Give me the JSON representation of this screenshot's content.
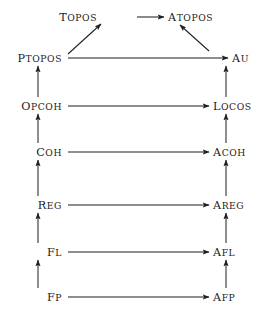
{
  "diagram": {
    "type": "commutative-diagram",
    "title": "",
    "style": {
      "line_color": "#1f1f1f",
      "text_color": "#1c1c1c",
      "background": "#ffffff"
    },
    "nodes": [
      {
        "id": "topos",
        "label": "TOPOS",
        "column": "left",
        "row": 0,
        "x": 97,
        "y": 17,
        "align": "right"
      },
      {
        "id": "atopos",
        "label": "ATOPOS",
        "column": "right",
        "row": 0,
        "x": 168,
        "y": 17,
        "align": "left"
      },
      {
        "id": "ptopos",
        "label": "PTOPOS",
        "column": "left",
        "row": 1,
        "x": 62,
        "y": 58,
        "align": "right"
      },
      {
        "id": "au",
        "label": "AU",
        "column": "right",
        "row": 1,
        "x": 232,
        "y": 58,
        "align": "left"
      },
      {
        "id": "opcoh",
        "label": "OPCOH",
        "column": "left",
        "row": 2,
        "x": 62,
        "y": 106,
        "align": "right"
      },
      {
        "id": "locos",
        "label": "LOCOS",
        "column": "right",
        "row": 2,
        "x": 213,
        "y": 106,
        "align": "left"
      },
      {
        "id": "coh",
        "label": "COH",
        "column": "left",
        "row": 3,
        "x": 62,
        "y": 152,
        "align": "right"
      },
      {
        "id": "acoh",
        "label": "ACOH",
        "column": "right",
        "row": 3,
        "x": 213,
        "y": 152,
        "align": "left"
      },
      {
        "id": "reg",
        "label": "REG",
        "column": "left",
        "row": 4,
        "x": 62,
        "y": 205,
        "align": "right"
      },
      {
        "id": "areg",
        "label": "AREG",
        "column": "right",
        "row": 4,
        "x": 213,
        "y": 205,
        "align": "left"
      },
      {
        "id": "fl",
        "label": "FL",
        "column": "left",
        "row": 5,
        "x": 62,
        "y": 252,
        "align": "right"
      },
      {
        "id": "afl",
        "label": "AFL",
        "column": "right",
        "row": 5,
        "x": 213,
        "y": 252,
        "align": "left"
      },
      {
        "id": "fp",
        "label": "FP",
        "column": "left",
        "row": 6,
        "x": 62,
        "y": 297,
        "align": "right"
      },
      {
        "id": "afp",
        "label": "AFP",
        "column": "right",
        "row": 6,
        "x": 213,
        "y": 297,
        "align": "left"
      }
    ],
    "edges": [
      {
        "id": "e-topos-atopos",
        "from": "topos",
        "to": "atopos",
        "kind": "horizontal",
        "x1": 137,
        "y1": 17,
        "x2": 164,
        "y2": 17
      },
      {
        "id": "e-ptopos-topos",
        "from": "ptopos",
        "to": "topos",
        "kind": "diagonal",
        "x1": 68,
        "y1": 54,
        "x2": 101,
        "y2": 24
      },
      {
        "id": "e-au-atopos",
        "from": "au",
        "to": "atopos",
        "kind": "diagonal",
        "x1": 209,
        "y1": 51,
        "x2": 180,
        "y2": 25
      },
      {
        "id": "e-ptopos-au",
        "from": "ptopos",
        "to": "au",
        "kind": "horizontal",
        "x1": 68,
        "y1": 58,
        "x2": 228,
        "y2": 58
      },
      {
        "id": "e-opcoh-locos",
        "from": "opcoh",
        "to": "locos",
        "kind": "horizontal",
        "x1": 68,
        "y1": 106,
        "x2": 209,
        "y2": 106
      },
      {
        "id": "e-coh-acoh",
        "from": "coh",
        "to": "acoh",
        "kind": "horizontal",
        "x1": 68,
        "y1": 152,
        "x2": 209,
        "y2": 152
      },
      {
        "id": "e-reg-areg",
        "from": "reg",
        "to": "areg",
        "kind": "horizontal",
        "x1": 68,
        "y1": 205,
        "x2": 209,
        "y2": 205
      },
      {
        "id": "e-fl-afl",
        "from": "fl",
        "to": "afl",
        "kind": "horizontal",
        "x1": 68,
        "y1": 252,
        "x2": 209,
        "y2": 252
      },
      {
        "id": "e-fp-afp",
        "from": "fp",
        "to": "afp",
        "kind": "horizontal",
        "x1": 68,
        "y1": 297,
        "x2": 209,
        "y2": 297
      },
      {
        "id": "e-opcoh-ptopos",
        "from": "opcoh",
        "to": "ptopos",
        "kind": "vertical",
        "x1": 38,
        "y1": 97,
        "x2": 38,
        "y2": 66
      },
      {
        "id": "e-coh-opcoh",
        "from": "coh",
        "to": "opcoh",
        "kind": "vertical",
        "x1": 38,
        "y1": 143,
        "x2": 38,
        "y2": 114
      },
      {
        "id": "e-reg-coh",
        "from": "reg",
        "to": "coh",
        "kind": "vertical",
        "x1": 38,
        "y1": 196,
        "x2": 38,
        "y2": 160
      },
      {
        "id": "e-fl-reg",
        "from": "fl",
        "to": "reg",
        "kind": "vertical",
        "x1": 38,
        "y1": 243,
        "x2": 38,
        "y2": 213
      },
      {
        "id": "e-fp-fl",
        "from": "fp",
        "to": "fl",
        "kind": "vertical",
        "x1": 38,
        "y1": 288,
        "x2": 38,
        "y2": 260
      },
      {
        "id": "e-locos-au",
        "from": "locos",
        "to": "au",
        "kind": "vertical",
        "x1": 226,
        "y1": 97,
        "x2": 226,
        "y2": 66
      },
      {
        "id": "e-acoh-locos",
        "from": "acoh",
        "to": "locos",
        "kind": "vertical",
        "x1": 226,
        "y1": 143,
        "x2": 226,
        "y2": 114
      },
      {
        "id": "e-areg-acoh",
        "from": "areg",
        "to": "acoh",
        "kind": "vertical",
        "x1": 226,
        "y1": 196,
        "x2": 226,
        "y2": 160
      },
      {
        "id": "e-afl-areg",
        "from": "afl",
        "to": "areg",
        "kind": "vertical",
        "x1": 226,
        "y1": 243,
        "x2": 226,
        "y2": 213
      },
      {
        "id": "e-afp-afl",
        "from": "afp",
        "to": "afl",
        "kind": "vertical",
        "x1": 226,
        "y1": 288,
        "x2": 226,
        "y2": 260
      }
    ]
  }
}
